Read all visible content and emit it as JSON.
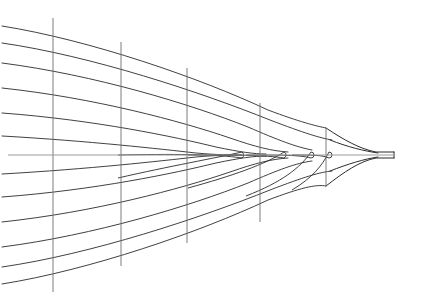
{
  "figure": {
    "orientation": "bow-to-the-right",
    "background_color": "#ffffff",
    "line_color": "#2b2b2b",
    "centerline_color": "#9a9a9a",
    "station_color": "#6e6e6e",
    "width": 434,
    "height": 296
  },
  "geometry": {
    "centerline_y": 155,
    "bow_tip_x": 394,
    "left_fade_start_x": 0,
    "left_fade_end_x": 34,
    "stem_neck_x": 326
  },
  "centerline": {
    "label": "centerline",
    "x1": 8,
    "y1": 155,
    "x2": 394,
    "y2": 155,
    "color": "#9a9a9a",
    "width": 1
  },
  "stations": [
    {
      "label": "station-1",
      "x": 53,
      "y_top": 18,
      "y_bottom": 292,
      "color": "#6e6e6e"
    },
    {
      "label": "station-2",
      "x": 121,
      "y_top": 42,
      "y_bottom": 266,
      "color": "#6e6e6e"
    },
    {
      "label": "station-3",
      "x": 187,
      "y_top": 68,
      "y_bottom": 243,
      "color": "#6e6e6e"
    },
    {
      "label": "station-4",
      "x": 260,
      "y_top": 103,
      "y_bottom": 222,
      "color": "#6e6e6e"
    },
    {
      "label": "station-5",
      "x": 326,
      "y_top": 128,
      "y_bottom": 186,
      "color": "#6e6e6e"
    }
  ],
  "waterlines_upper": [
    {
      "label": "waterline-U1",
      "start_y": 26,
      "mid_y": 52,
      "converge_x": 326,
      "converge_y": 128
    },
    {
      "label": "waterline-U2",
      "start_y": 43,
      "mid_y": 68,
      "converge_x": 330,
      "converge_y": 140
    },
    {
      "label": "waterline-U3",
      "start_y": 63,
      "mid_y": 86,
      "converge_x": 300,
      "converge_y": 150
    },
    {
      "label": "waterline-U4",
      "start_y": 88,
      "mid_y": 105,
      "converge_x": 265,
      "converge_y": 152
    },
    {
      "label": "waterline-U5",
      "start_y": 113,
      "mid_y": 126,
      "converge_x": 232,
      "converge_y": 153
    },
    {
      "label": "waterline-U6",
      "start_y": 136,
      "mid_y": 144,
      "converge_x": 200,
      "converge_y": 154
    }
  ],
  "waterlines_lower": [
    {
      "label": "waterline-L1",
      "start_y": 284,
      "mid_y": 258,
      "converge_x": 326,
      "converge_y": 186
    },
    {
      "label": "waterline-L2",
      "start_y": 267,
      "mid_y": 242,
      "converge_x": 330,
      "converge_y": 172
    },
    {
      "label": "waterline-L3",
      "start_y": 247,
      "mid_y": 224,
      "converge_x": 300,
      "converge_y": 161
    },
    {
      "label": "waterline-L4",
      "start_y": 222,
      "mid_y": 205,
      "converge_x": 265,
      "converge_y": 159
    },
    {
      "label": "waterline-L5",
      "start_y": 197,
      "mid_y": 184,
      "converge_x": 232,
      "converge_y": 158
    },
    {
      "label": "waterline-L6",
      "start_y": 174,
      "mid_y": 166,
      "converge_x": 200,
      "converge_y": 157
    }
  ],
  "nested_tips": [
    {
      "label": "waterline-tip-1",
      "tip_x": 248,
      "half_width": 4
    },
    {
      "label": "waterline-tip-2",
      "tip_x": 286,
      "half_width": 3.5
    },
    {
      "label": "waterline-tip-3",
      "tip_x": 313,
      "half_width": 3
    },
    {
      "label": "waterline-tip-4",
      "tip_x": 330,
      "half_width": 2.5
    }
  ],
  "stem": {
    "label": "stem-profile",
    "neck_x": 326,
    "tip_x": 394,
    "upper_flare_y": 128,
    "lower_flare_y": 186,
    "tip_half_width": 2.5
  }
}
